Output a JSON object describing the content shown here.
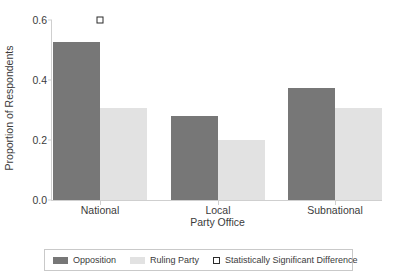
{
  "chart_data": {
    "type": "bar",
    "title": "",
    "xlabel": "Party Office",
    "ylabel": "Proportion of Respondents",
    "categories": [
      "National",
      "Local",
      "Subnational"
    ],
    "series": [
      {
        "name": "Opposition",
        "values": [
          0.527,
          0.28,
          0.373
        ],
        "color": "#777777"
      },
      {
        "name": "Ruling Party",
        "values": [
          0.307,
          0.2,
          0.307
        ],
        "color": "#e2e2e2"
      }
    ],
    "ylim": [
      0.0,
      0.6
    ],
    "yticks": [
      "0.0",
      "0.2",
      "0.4",
      "0.6"
    ],
    "ytick_values": [
      0.0,
      0.2,
      0.4,
      0.6
    ],
    "grid": false,
    "legend_position": "bottom",
    "significance_markers": [
      {
        "category": "National",
        "value": 0.6,
        "label": "Statistically Significant Difference"
      }
    ]
  },
  "axes": {
    "ylabel": "Proportion of Respondents",
    "xlabel": "Party Office",
    "ytick_0": "0.0",
    "ytick_1": "0.2",
    "ytick_2": "0.4",
    "ytick_3": "0.6",
    "xtick_0": "National",
    "xtick_1": "Local",
    "xtick_2": "Subnational"
  },
  "legend": {
    "items": [
      {
        "label": "Opposition",
        "marker": "filled-rect-dark-gray"
      },
      {
        "label": "Ruling Party",
        "marker": "filled-rect-light-gray"
      },
      {
        "label": "Statistically Significant Difference",
        "marker": "open-square"
      }
    ]
  },
  "colors": {
    "opposition": "#777777",
    "ruling_party": "#e2e2e2",
    "axis": "#cfcfcf",
    "text": "#3b3b3b",
    "marker_outline": "#2b2b2b"
  }
}
